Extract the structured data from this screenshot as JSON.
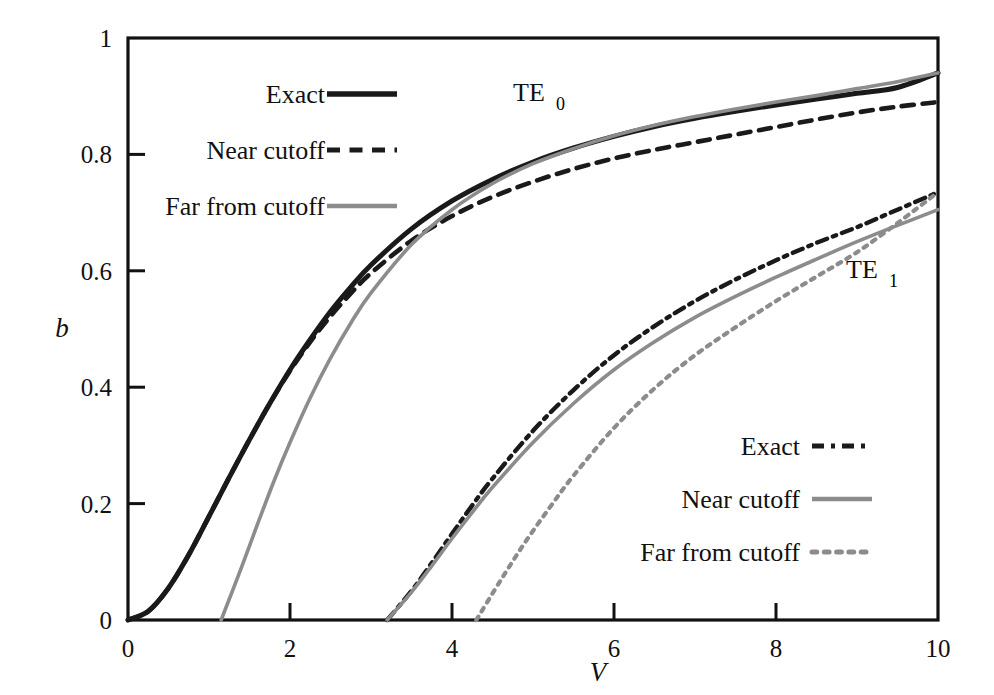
{
  "figure": {
    "background_color": "#ffffff",
    "frame_color": "#111111",
    "dark_color": "#1a1a1a",
    "gray_color": "#8c8c8c"
  },
  "axes": {
    "x_title": "V",
    "y_title": "b",
    "x_ticks": [
      "0",
      "2",
      "4",
      "6",
      "8",
      "10"
    ],
    "y_ticks": [
      "0",
      "0.2",
      "0.4",
      "0.6",
      "0.8",
      "1"
    ],
    "xlim": [
      0,
      10
    ],
    "ylim": [
      0,
      1
    ]
  },
  "annotations": {
    "te0": {
      "base": "TE",
      "sub": "0"
    },
    "te1": {
      "base": "TE",
      "sub": "1"
    }
  },
  "legend_te0": {
    "title": "TE0 legend",
    "items": [
      {
        "label": "Exact",
        "style": "solid",
        "color": "#1a1a1a",
        "width": 4.5
      },
      {
        "label": "Near cutoff",
        "style": "dashed",
        "color": "#1a1a1a",
        "width": 4.0
      },
      {
        "label": "Far from cutoff",
        "style": "solid",
        "color": "#8c8c8c",
        "width": 3.4
      }
    ]
  },
  "legend_te1": {
    "title": "TE1 legend",
    "items": [
      {
        "label": "Exact",
        "style": "dashdot",
        "color": "#1a1a1a",
        "width": 4.0
      },
      {
        "label": "Near cutoff",
        "style": "solid",
        "color": "#8c8c8c",
        "width": 3.4
      },
      {
        "label": "Far from cutoff",
        "style": "dotted",
        "color": "#8c8c8c",
        "width": 4.0
      }
    ]
  },
  "chart_data": {
    "type": "line",
    "title": "",
    "xlabel": "V",
    "ylabel": "b",
    "xlim": [
      0,
      10
    ],
    "ylim": [
      0,
      1
    ],
    "xticks": [
      0,
      2,
      4,
      6,
      8,
      10
    ],
    "yticks": [
      0,
      0.2,
      0.4,
      0.6,
      0.8,
      1
    ],
    "grid": false,
    "legend_position": [
      "upper-left-inside",
      "lower-right-inside"
    ],
    "series": [
      {
        "name": "TE0 Exact",
        "group": "TE0",
        "style": "solid",
        "color": "#1a1a1a",
        "x": [
          0,
          0.25,
          0.5,
          0.75,
          1.0,
          1.25,
          1.5,
          1.75,
          2.0,
          2.25,
          2.5,
          2.75,
          3.0,
          3.5,
          4.0,
          4.5,
          5.0,
          5.5,
          6.0,
          6.5,
          7.0,
          7.5,
          8.0,
          8.5,
          9.0,
          9.5,
          10.0
        ],
        "y": [
          0.0,
          0.015,
          0.055,
          0.112,
          0.178,
          0.245,
          0.31,
          0.372,
          0.43,
          0.482,
          0.53,
          0.572,
          0.61,
          0.672,
          0.72,
          0.757,
          0.787,
          0.811,
          0.831,
          0.848,
          0.862,
          0.874,
          0.885,
          0.895,
          0.905,
          0.915,
          0.94
        ]
      },
      {
        "name": "TE0 Near cutoff",
        "group": "TE0",
        "style": "dashed",
        "color": "#1a1a1a",
        "x": [
          0,
          0.25,
          0.5,
          0.75,
          1.0,
          1.25,
          1.5,
          1.75,
          2.0,
          2.25,
          2.5,
          2.75,
          3.0,
          3.5,
          4.0,
          4.5,
          5.0,
          5.5,
          6.0,
          6.5,
          7.0,
          7.5,
          8.0,
          8.5,
          9.0,
          9.5,
          10.0
        ],
        "y": [
          0.0,
          0.015,
          0.055,
          0.112,
          0.178,
          0.245,
          0.31,
          0.372,
          0.428,
          0.478,
          0.522,
          0.561,
          0.596,
          0.652,
          0.694,
          0.727,
          0.753,
          0.775,
          0.793,
          0.808,
          0.821,
          0.834,
          0.847,
          0.86,
          0.872,
          0.882,
          0.89
        ]
      },
      {
        "name": "TE0 Far from cutoff",
        "group": "TE0",
        "style": "solid",
        "color": "#8c8c8c",
        "cutoff_start": 1.15,
        "x": [
          1.15,
          1.4,
          1.6,
          1.8,
          2.0,
          2.25,
          2.5,
          2.75,
          3.0,
          3.5,
          4.0,
          4.5,
          5.0,
          5.5,
          6.0,
          6.5,
          7.0,
          7.5,
          8.0,
          8.5,
          9.0,
          9.5,
          10.0
        ],
        "y": [
          0.0,
          0.09,
          0.165,
          0.238,
          0.305,
          0.382,
          0.45,
          0.51,
          0.562,
          0.645,
          0.705,
          0.75,
          0.784,
          0.81,
          0.832,
          0.85,
          0.865,
          0.878,
          0.89,
          0.901,
          0.913,
          0.925,
          0.94
        ]
      },
      {
        "name": "TE1 Exact",
        "group": "TE1",
        "style": "dashdot",
        "color": "#1a1a1a",
        "cutoff_start": 3.2,
        "x": [
          3.2,
          3.5,
          3.75,
          4.0,
          4.25,
          4.5,
          5.0,
          5.5,
          6.0,
          6.5,
          7.0,
          7.5,
          8.0,
          8.5,
          9.0,
          9.5,
          10.0
        ],
        "y": [
          0.0,
          0.05,
          0.098,
          0.148,
          0.197,
          0.243,
          0.325,
          0.395,
          0.455,
          0.505,
          0.548,
          0.585,
          0.618,
          0.648,
          0.675,
          0.705,
          0.735
        ]
      },
      {
        "name": "TE1 Near cutoff",
        "group": "TE1",
        "style": "solid",
        "color": "#8c8c8c",
        "cutoff_start": 3.2,
        "x": [
          3.2,
          3.5,
          3.75,
          4.0,
          4.25,
          4.5,
          5.0,
          5.5,
          6.0,
          6.5,
          7.0,
          7.5,
          8.0,
          8.5,
          9.0,
          9.5,
          10.0
        ],
        "y": [
          0.0,
          0.048,
          0.093,
          0.14,
          0.185,
          0.228,
          0.305,
          0.372,
          0.43,
          0.478,
          0.52,
          0.556,
          0.589,
          0.62,
          0.65,
          0.678,
          0.705
        ]
      },
      {
        "name": "TE1 Far from cutoff",
        "group": "TE1",
        "style": "dotted",
        "color": "#8c8c8c",
        "cutoff_start": 4.3,
        "x": [
          4.3,
          4.6,
          4.9,
          5.2,
          5.5,
          6.0,
          6.5,
          7.0,
          7.5,
          8.0,
          8.5,
          9.0,
          9.5,
          10.0
        ],
        "y": [
          0.0,
          0.068,
          0.133,
          0.192,
          0.248,
          0.33,
          0.398,
          0.455,
          0.503,
          0.548,
          0.59,
          0.632,
          0.682,
          0.735
        ]
      }
    ]
  }
}
